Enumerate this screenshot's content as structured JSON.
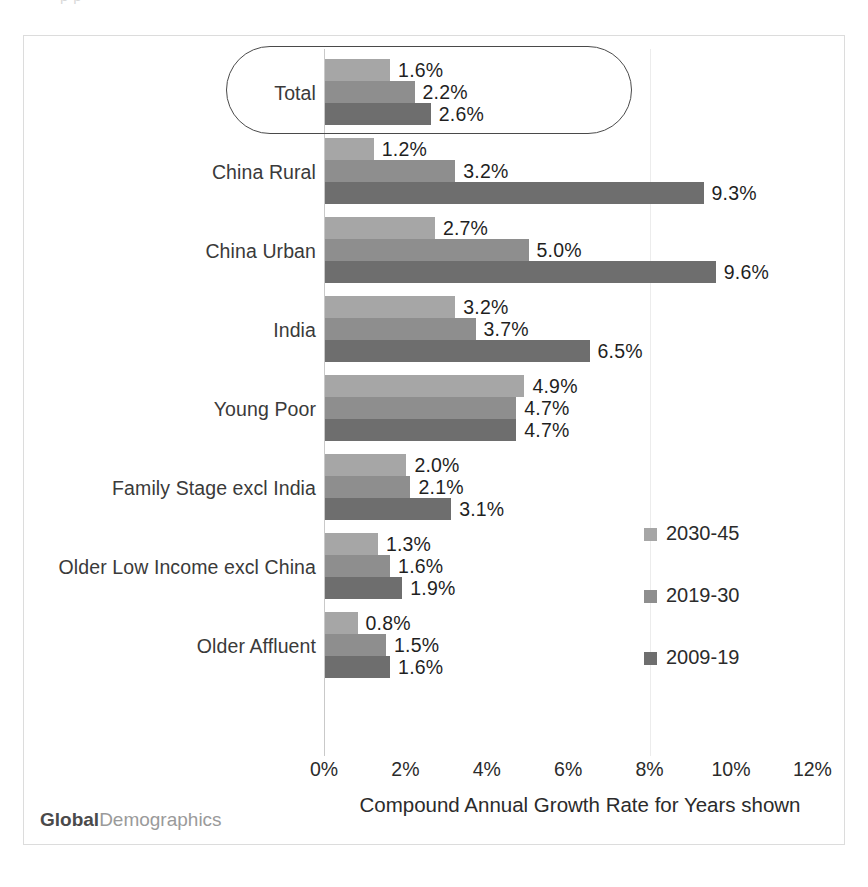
{
  "top_cut_text": "p                       p",
  "chart_data": {
    "type": "bar",
    "orientation": "horizontal",
    "title": "",
    "xlabel": "Compound Annual Growth Rate for Years shown",
    "ylabel": "",
    "xlim": [
      0,
      12
    ],
    "xticks": [
      "0%",
      "2%",
      "4%",
      "6%",
      "8%",
      "10%",
      "12%"
    ],
    "xtick_values": [
      0,
      2,
      4,
      6,
      8,
      10,
      12
    ],
    "grid": false,
    "legend_position": "right-middle",
    "value_suffix": "%",
    "categories": [
      "Total",
      "China Rural",
      "China Urban",
      "India",
      "Young Poor",
      "Family Stage  excl India",
      "Older Low Income excl China",
      "Older Affluent"
    ],
    "series": [
      {
        "name": "2030-45",
        "color": "#a6a6a6",
        "values": [
          1.6,
          1.2,
          2.7,
          3.2,
          4.9,
          2.0,
          1.3,
          0.8
        ],
        "labels": [
          "1.6%",
          "1.2%",
          "2.7%",
          "3.2%",
          "4.9%",
          "2.0%",
          "1.3%",
          "0.8%"
        ]
      },
      {
        "name": "2019-30",
        "color": "#8e8e8e",
        "values": [
          2.2,
          3.2,
          5.0,
          3.7,
          4.7,
          2.1,
          1.6,
          1.5
        ],
        "labels": [
          "2.2%",
          "3.2%",
          "5.0%",
          "3.7%",
          "4.7%",
          "2.1%",
          "1.6%",
          "1.5%"
        ]
      },
      {
        "name": "2009-19",
        "color": "#6e6e6e",
        "values": [
          2.6,
          9.3,
          9.6,
          6.5,
          4.7,
          3.1,
          1.9,
          1.6
        ],
        "labels": [
          "2.6%",
          "9.3%",
          "9.6%",
          "6.5%",
          "4.7%",
          "3.1%",
          "1.9%",
          "1.6%"
        ]
      }
    ],
    "annotations": [
      {
        "type": "rounded-rect-callout",
        "target_category": "Total"
      }
    ]
  },
  "watermark": {
    "bold_part": "Global",
    "light_part": "Demographics"
  }
}
